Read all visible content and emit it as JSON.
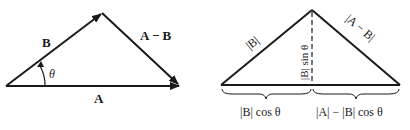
{
  "left": {
    "label_B": "B",
    "label_AminusB": "A − B",
    "label_theta": "θ",
    "label_A": "A"
  },
  "right": {
    "label_absB": "|B|",
    "label_absAminusB": "|A − B|",
    "label_Bsin": "|B| sin θ",
    "label_Bcos": "|B| cos θ",
    "label_AminusBcos": "|A| − |B| cos θ"
  },
  "colors": {
    "ink": "#1a1a1a",
    "background": "#ffffff"
  }
}
